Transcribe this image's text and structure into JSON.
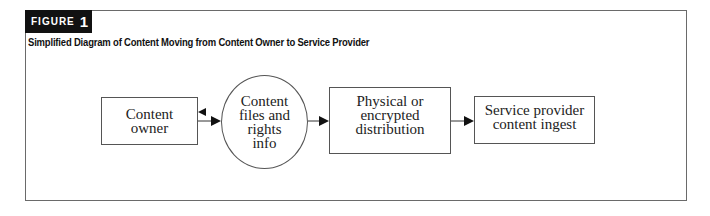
{
  "figure": {
    "label_word": "FIGURE",
    "label_number": "1",
    "title": "Simplified Diagram of Content Moving from Content Owner to Service Provider"
  },
  "diagram": {
    "nodes": [
      {
        "id": "content-owner",
        "shape": "rectangle",
        "label": "Content\nowner"
      },
      {
        "id": "content-files",
        "shape": "ellipse",
        "label": "Content\nfiles and\nrights\ninfo"
      },
      {
        "id": "distribution",
        "shape": "rectangle",
        "label": "Physical or\nencrypted\ndistribution"
      },
      {
        "id": "service-ingest",
        "shape": "rectangle",
        "label": "Service provider\ncontent ingest"
      }
    ],
    "edges": [
      {
        "from": "content-files",
        "to": "content-owner"
      },
      {
        "from": "content-owner",
        "to": "content-files"
      },
      {
        "from": "content-files",
        "to": "distribution"
      },
      {
        "from": "distribution",
        "to": "service-ingest"
      }
    ]
  }
}
